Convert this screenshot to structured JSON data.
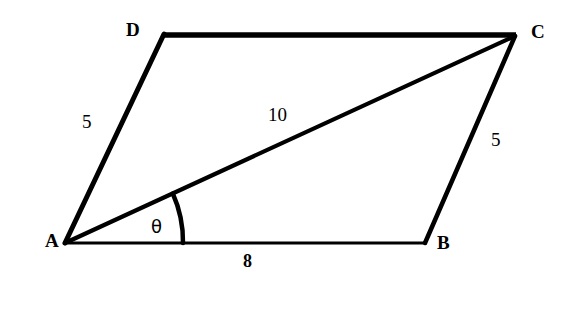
{
  "figure": {
    "type": "geometry-diagram",
    "shape": "parallelogram",
    "background_color": "#ffffff",
    "stroke_color": "#000000",
    "vertices": [
      {
        "name": "A",
        "label": "A",
        "x": 65,
        "y": 243,
        "label_x": 45,
        "label_y": 231
      },
      {
        "name": "B",
        "label": "B",
        "x": 425,
        "y": 243,
        "label_x": 437,
        "label_y": 233
      },
      {
        "name": "C",
        "label": "C",
        "x": 515,
        "y": 35,
        "label_x": 531,
        "label_y": 22
      },
      {
        "name": "D",
        "label": "D",
        "x": 164,
        "y": 34,
        "label_x": 126,
        "label_y": 20
      }
    ],
    "edges": [
      {
        "name": "AB",
        "from": "A",
        "to": "B",
        "length_label": "8",
        "label_x": 243,
        "label_y": 252,
        "stroke_width": 3
      },
      {
        "name": "BC",
        "from": "B",
        "to": "C",
        "length_label": "5",
        "label_x": 491,
        "label_y": 130,
        "stroke_width": 4
      },
      {
        "name": "DC",
        "from": "D",
        "to": "C",
        "length_label": "",
        "label_x": 0,
        "label_y": 0,
        "stroke_width": 5
      },
      {
        "name": "AD",
        "from": "A",
        "to": "D",
        "length_label": "5",
        "label_x": 82,
        "label_y": 112,
        "stroke_width": 5
      }
    ],
    "diagonal": {
      "name": "AC",
      "from": "A",
      "to": "C",
      "length_label": "10",
      "label_x": 268,
      "label_y": 105,
      "stroke_width": 4
    },
    "angle": {
      "name": "theta",
      "symbol": "θ",
      "at_vertex": "A",
      "between": [
        "AB",
        "AC"
      ],
      "label_x": 151,
      "label_y": 218,
      "arc_radius": 118,
      "arc_stroke_width": 4
    },
    "labels": {
      "vertex_a": "A",
      "vertex_b": "B",
      "vertex_c": "C",
      "vertex_d": "D",
      "side_ad": "5",
      "side_bc": "5",
      "side_ab": "8",
      "diagonal_ac": "10",
      "angle_theta": "θ"
    }
  }
}
